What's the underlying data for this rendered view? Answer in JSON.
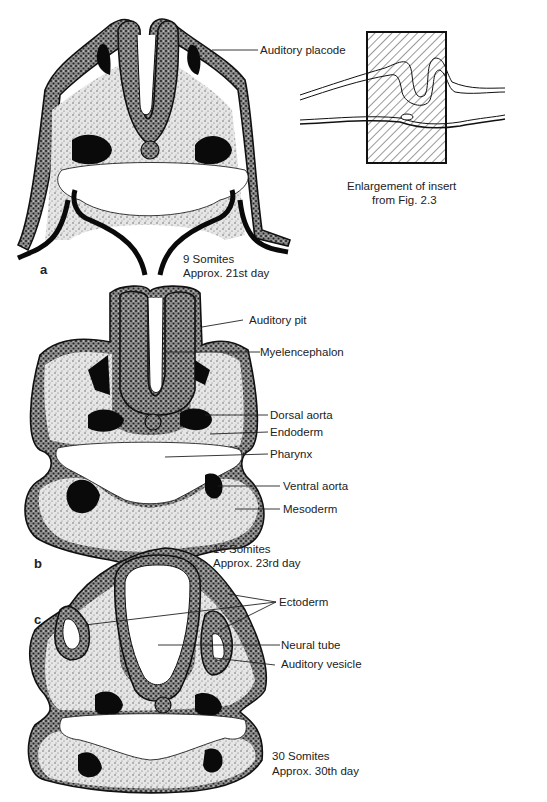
{
  "figure": {
    "panels": [
      {
        "id": "a",
        "letter": "a",
        "stage": "9 Somites",
        "age": "Approx. 21st day",
        "labels": [
          "Auditory placode"
        ]
      },
      {
        "id": "b",
        "letter": "b",
        "stage": "16 Somites",
        "age": "Approx. 23rd day",
        "labels": [
          "Auditory pit",
          "Myelencephalon",
          "Dorsal aorta",
          "Endoderm",
          "Pharynx",
          "Ventral aorta",
          "Mesoderm"
        ]
      },
      {
        "id": "c",
        "letter": "c",
        "stage": "30 Somites",
        "age": "Approx. 30th day",
        "labels": [
          "Ectoderm",
          "Neural tube",
          "Auditory vesicle"
        ]
      }
    ],
    "insert": {
      "caption_line1": "Enlargement of insert",
      "caption_line2": "from Fig. 2.3"
    }
  },
  "colors": {
    "ink": "#111111",
    "paper": "#ffffff"
  }
}
